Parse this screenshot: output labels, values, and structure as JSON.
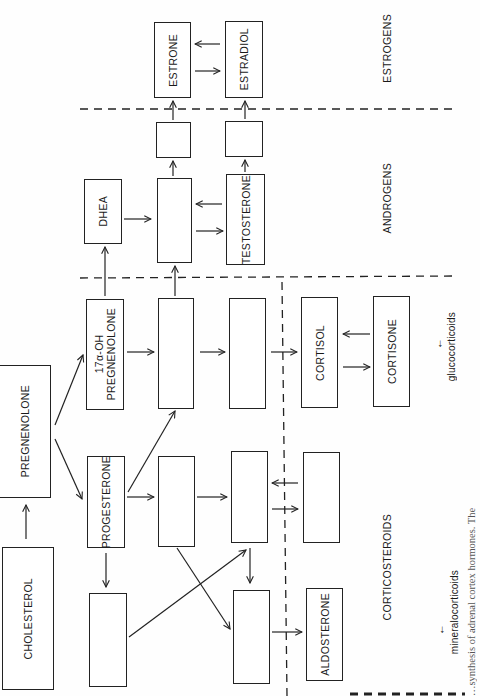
{
  "diagram": {
    "orientation": "rotated 90deg counter-clockwise",
    "boxes": {
      "cholesterol": {
        "label": "CHOLESTEROL",
        "x": 2,
        "y": 547,
        "w": 52,
        "h": 143
      },
      "pregnenolone": {
        "label": "PREGNENOLONE",
        "x": 0,
        "y": 365,
        "w": 51,
        "h": 133
      },
      "progesterone": {
        "label": "PROGESTERONE",
        "x": 87,
        "y": 456,
        "w": 38,
        "h": 92
      },
      "oh_pregnenolone": {
        "label": "17α-OH\nPREGNENOLONE",
        "x": 86,
        "y": 299,
        "w": 38,
        "h": 111
      },
      "blank_below_progesterone": {
        "label": "",
        "x": 89,
        "y": 593,
        "w": 38,
        "h": 94
      },
      "blank_col2_low": {
        "label": "",
        "x": 158,
        "y": 456,
        "w": 37,
        "h": 91
      },
      "blank_col2_mid": {
        "label": "",
        "x": 158,
        "y": 298,
        "w": 36,
        "h": 111
      },
      "blank_col2_top": {
        "label": "",
        "x": 157,
        "y": 178,
        "w": 35,
        "h": 85
      },
      "dhea": {
        "label": "DHEA",
        "x": 84,
        "y": 179,
        "w": 38,
        "h": 65
      },
      "blank_col3_mid": {
        "label": "",
        "x": 229,
        "y": 298,
        "w": 37,
        "h": 111
      },
      "blank_col3_low": {
        "label": "",
        "x": 231,
        "y": 451,
        "w": 37,
        "h": 92
      },
      "blank_col3_bottom": {
        "label": "",
        "x": 233,
        "y": 590,
        "w": 37,
        "h": 94
      },
      "testosterone": {
        "label": "TESTOSTERONE",
        "x": 226,
        "y": 174,
        "w": 39,
        "h": 91
      },
      "blank_andro_1": {
        "label": "",
        "x": 156,
        "y": 122,
        "w": 35,
        "h": 36
      },
      "blank_andro_2": {
        "label": "",
        "x": 225,
        "y": 121,
        "w": 38,
        "h": 36
      },
      "estrone": {
        "label": "ESTRONE",
        "x": 154,
        "y": 22,
        "w": 37,
        "h": 76
      },
      "estradiol": {
        "label": "ESTRADIOL",
        "x": 225,
        "y": 21,
        "w": 38,
        "h": 77
      },
      "cortisol": {
        "label": "CORTISOL",
        "x": 301,
        "y": 297,
        "w": 37,
        "h": 111
      },
      "cortisone": {
        "label": "CORTISONE",
        "x": 373,
        "y": 296,
        "w": 37,
        "h": 111
      },
      "blank_cortico": {
        "label": "",
        "x": 303,
        "y": 452,
        "w": 37,
        "h": 91
      },
      "aldosterone": {
        "label": "ALDOSTERONE",
        "x": 306,
        "y": 588,
        "w": 37,
        "h": 93
      }
    },
    "group_labels": {
      "estrogens": {
        "label": "ESTROGENS",
        "x": 381,
        "y": 18
      },
      "androgens": {
        "label": "ANDROGENS",
        "x": 381,
        "y": 165
      },
      "corticosteroids": {
        "label": "CORTICOSTEROIDS",
        "x": 381,
        "y": 516
      },
      "glucocorticoids": {
        "label": "glucocorticoids",
        "x": 446,
        "y": 312,
        "arrow": "←"
      },
      "mineralocorticoids": {
        "label": "mineralocorticoids",
        "x": 449,
        "y": 570,
        "arrow": "←"
      }
    },
    "caption": "…synthesis of adrenal cortex hormones. The"
  }
}
